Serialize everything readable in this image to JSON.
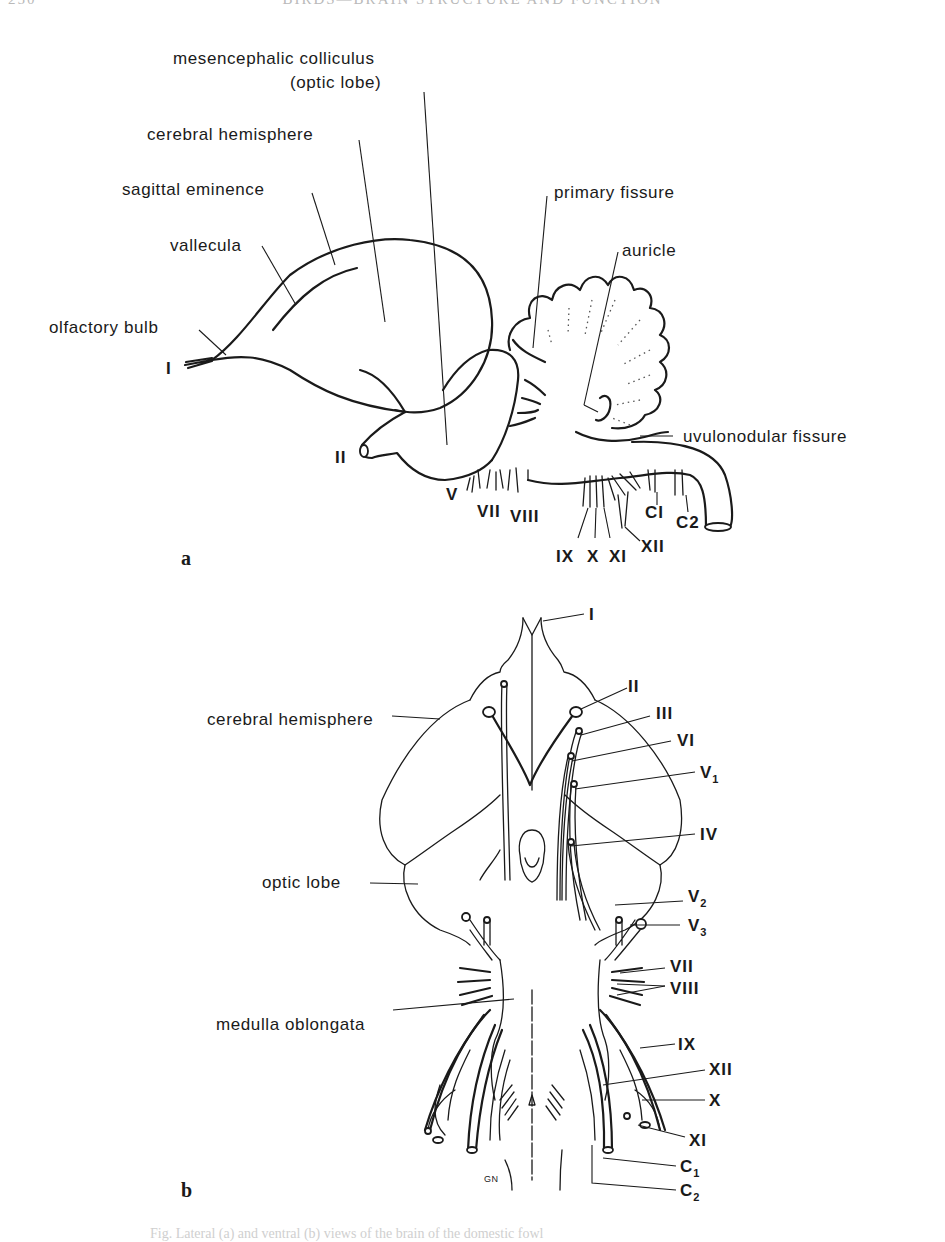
{
  "page": {
    "running_head": "BIRDS—BRAIN STRUCTURE AND FUNCTION",
    "page_number": "250",
    "caption_fragment": "Fig. Lateral (a) and ventral (b) views of the brain of the domestic fowl"
  },
  "panel_a": {
    "panel_label": "a",
    "labels": {
      "mesencephalic_colliculus": "mesencephalic colliculus",
      "optic_lobe_paren": "(optic lobe)",
      "cerebral_hemisphere": "cerebral hemisphere",
      "sagittal_eminence": "sagittal eminence",
      "vallecula": "vallecula",
      "olfactory_bulb": "olfactory bulb",
      "primary_fissure": "primary fissure",
      "auricle": "auricle",
      "uvulonodular_fissure": "uvulonodular fissure"
    },
    "nerves": {
      "I": "I",
      "II": "II",
      "V": "V",
      "VII": "VII",
      "VIII": "VIII",
      "IX": "IX",
      "X": "X",
      "XI": "XI",
      "XII": "XII",
      "C1": "CI",
      "C2": "C2"
    }
  },
  "panel_b": {
    "panel_label": "b",
    "labels": {
      "cerebral_hemisphere": "cerebral hemisphere",
      "optic_lobe": "optic lobe",
      "medulla_oblongata": "medulla oblongata",
      "artist_signature": "GN"
    },
    "nerves": {
      "I": "I",
      "II": "II",
      "III": "III",
      "VI": "VI",
      "V1": "V",
      "V1_sub": "1",
      "IV": "IV",
      "V2": "V",
      "V2_sub": "2",
      "V3": "V",
      "V3_sub": "3",
      "VII": "VII",
      "VIII": "VIII",
      "IX": "IX",
      "XII": "XII",
      "X": "X",
      "XI": "XI",
      "C1": "C",
      "C1_sub": "1",
      "C2": "C",
      "C2_sub": "2"
    }
  }
}
